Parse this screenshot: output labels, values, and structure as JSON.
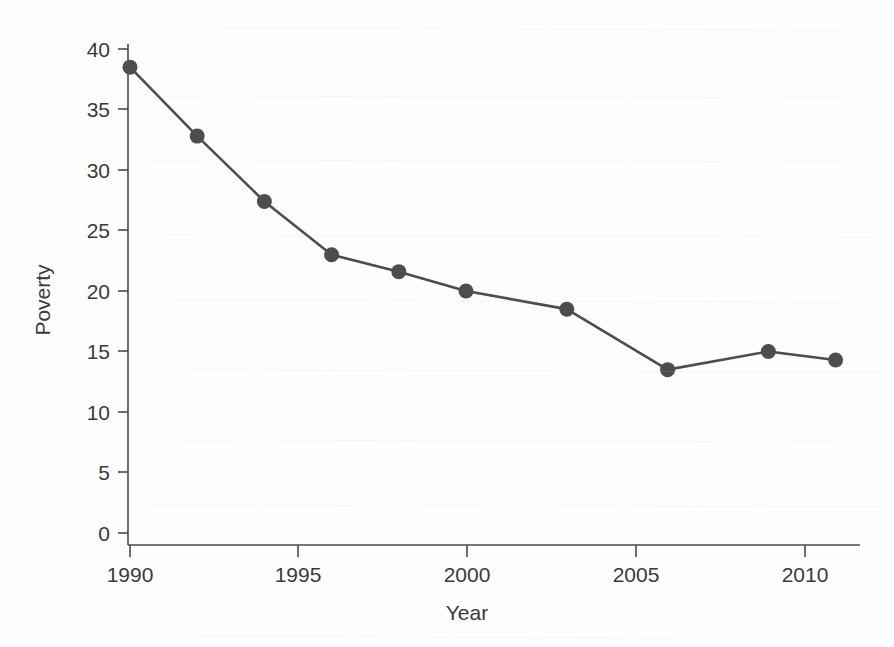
{
  "chart_data": {
    "type": "line",
    "title": "",
    "xlabel": "Year",
    "ylabel": "Poverty",
    "x": [
      1990,
      1992,
      1994,
      1996,
      1998,
      2000,
      2003,
      2006,
      2009,
      2011
    ],
    "values": [
      38.5,
      32.8,
      27.4,
      23.0,
      21.6,
      20.0,
      18.5,
      13.5,
      15.0,
      14.3
    ],
    "series": [
      {
        "name": "Poverty",
        "values": [
          38.5,
          32.8,
          27.4,
          23.0,
          21.6,
          20.0,
          18.5,
          13.5,
          15.0,
          14.3
        ]
      }
    ],
    "xlim": [
      1989.3,
      2011.9
    ],
    "ylim": [
      0,
      41
    ],
    "xticks": [
      1990,
      1995,
      2000,
      2005,
      2010
    ],
    "xtick_labels": [
      "1990",
      "1995",
      "2000",
      "2005",
      "2010"
    ],
    "yticks": [
      0,
      5,
      10,
      15,
      20,
      25,
      30,
      35,
      40
    ],
    "ytick_labels": [
      "0",
      "5",
      "10",
      "15",
      "20",
      "25",
      "30",
      "35",
      "40"
    ],
    "grid": false,
    "legend": null,
    "marker": "circle",
    "line_color": "#4d4d4d",
    "marker_color": "#4d4d4d",
    "axis_color": "#4a4a4a",
    "background_color": "#ffffff"
  }
}
